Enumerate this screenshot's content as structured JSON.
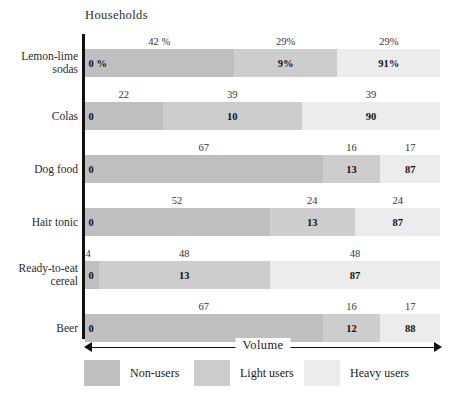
{
  "chart_data": {
    "type": "bar",
    "orientation": "horizontal",
    "stacked": true,
    "title": "",
    "top_axis_label": "Households",
    "bottom_axis_label": "Volume",
    "xlabel": "Volume",
    "ylabel": "",
    "xlim": [
      0,
      100
    ],
    "grid": false,
    "legend_position": "bottom",
    "categories": [
      "Lemon-lime sodas",
      "Colas",
      "Dog food",
      "Hair tonic",
      "Ready-to-eat cereal",
      "Beer"
    ],
    "series": [
      {
        "name": "Non-users",
        "color": "#bfbfbf",
        "households": [
          42,
          22,
          67,
          52,
          4,
          67
        ],
        "volume": [
          0,
          0,
          0,
          0,
          0,
          0
        ]
      },
      {
        "name": "Light users",
        "color": "#cdcdcd",
        "households": [
          29,
          39,
          16,
          24,
          48,
          16
        ],
        "volume": [
          9,
          10,
          13,
          13,
          13,
          12
        ]
      },
      {
        "name": "Heavy users",
        "color": "#ececec",
        "households": [
          29,
          39,
          17,
          24,
          48,
          17
        ],
        "volume": [
          91,
          90,
          87,
          87,
          87,
          88
        ]
      }
    ],
    "annotations": {
      "households_note": "Percent of households, shown above each bar",
      "volume_note": "Percent of volume, shown inside each bar"
    }
  },
  "rows": [
    {
      "label": "Lemon-lime sodas",
      "label_lines": [
        "Lemon-lime",
        "sodas"
      ],
      "segments": [
        {
          "key": "non",
          "households_label": "42 %",
          "volume_label": "0 %",
          "households": 42
        },
        {
          "key": "light",
          "households_label": "29%",
          "volume_label": "9%",
          "households": 29
        },
        {
          "key": "heavy",
          "households_label": "29%",
          "volume_label": "91%",
          "households": 29
        }
      ]
    },
    {
      "label": "Colas",
      "label_lines": [
        "Colas"
      ],
      "segments": [
        {
          "key": "non",
          "households_label": "22",
          "volume_label": "0",
          "households": 22
        },
        {
          "key": "light",
          "households_label": "39",
          "volume_label": "10",
          "households": 39
        },
        {
          "key": "heavy",
          "households_label": "39",
          "volume_label": "90",
          "households": 39
        }
      ]
    },
    {
      "label": "Dog food",
      "label_lines": [
        "Dog food"
      ],
      "segments": [
        {
          "key": "non",
          "households_label": "67",
          "volume_label": "0",
          "households": 67
        },
        {
          "key": "light",
          "households_label": "16",
          "volume_label": "13",
          "households": 16
        },
        {
          "key": "heavy",
          "households_label": "17",
          "volume_label": "87",
          "households": 17
        }
      ]
    },
    {
      "label": "Hair tonic",
      "label_lines": [
        "Hair tonic"
      ],
      "segments": [
        {
          "key": "non",
          "households_label": "52",
          "volume_label": "0",
          "households": 52
        },
        {
          "key": "light",
          "households_label": "24",
          "volume_label": "13",
          "households": 24
        },
        {
          "key": "heavy",
          "households_label": "24",
          "volume_label": "87",
          "households": 24
        }
      ]
    },
    {
      "label": "Ready-to-eat cereal",
      "label_lines": [
        "Ready-to-eat",
        "cereal"
      ],
      "segments": [
        {
          "key": "non",
          "households_label": "4",
          "volume_label": "0",
          "households": 4
        },
        {
          "key": "light",
          "households_label": "48",
          "volume_label": "13",
          "households": 48
        },
        {
          "key": "heavy",
          "households_label": "48",
          "volume_label": "87",
          "households": 48
        }
      ]
    },
    {
      "label": "Beer",
      "label_lines": [
        "Beer"
      ],
      "segments": [
        {
          "key": "non",
          "households_label": "67",
          "volume_label": "0",
          "households": 67
        },
        {
          "key": "light",
          "households_label": "16",
          "volume_label": "12",
          "households": 16
        },
        {
          "key": "heavy",
          "households_label": "17",
          "volume_label": "88",
          "households": 17
        }
      ]
    }
  ],
  "legend": [
    {
      "key": "non",
      "label": "Non-users",
      "color": "#bfbfbf"
    },
    {
      "key": "light",
      "label": "Light users",
      "color": "#cdcdcd"
    },
    {
      "key": "heavy",
      "label": "Heavy users",
      "color": "#ececec"
    }
  ],
  "colors": {
    "non_users": "#bfbfbf",
    "light_users": "#cdcdcd",
    "heavy_users": "#ececec",
    "axis": "#111111",
    "text": "#1a1a1a",
    "background": "#ffffff"
  }
}
